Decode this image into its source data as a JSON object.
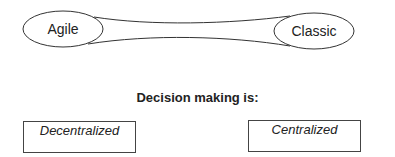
{
  "diagram": {
    "left_node": "Agile",
    "right_node": "Classic",
    "heading": "Decision making is:",
    "left_box": "Decentralized",
    "right_box": "Centralized"
  }
}
